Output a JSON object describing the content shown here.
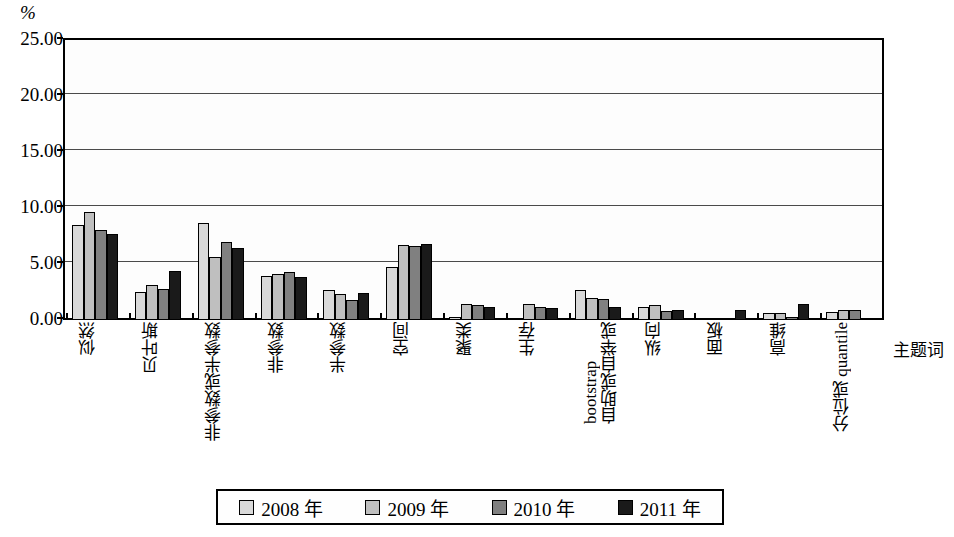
{
  "chart_data": {
    "type": "bar",
    "title": "",
    "xlabel": "主题词",
    "ylabel": "%",
    "ylim": [
      0,
      25
    ],
    "yticks": [
      "0.00",
      "5.00",
      "10.00",
      "15.00",
      "20.00",
      "25.00"
    ],
    "grid": true,
    "legend_position": "bottom",
    "categories": [
      "似然",
      "贝叶斯",
      "非参数或半参数",
      "非参数",
      "半参数",
      "空间",
      "聚类",
      "生存",
      "自助或自举或 bootstrap",
      "纵向",
      "面板",
      "高维",
      "分位或 quantile"
    ],
    "category_lines": [
      [
        "似然"
      ],
      [
        "贝叶斯"
      ],
      [
        "非参数或半参数"
      ],
      [
        "非参数"
      ],
      [
        "半参数"
      ],
      [
        "空间"
      ],
      [
        "聚类"
      ],
      [
        "生存"
      ],
      [
        "自助或自举或",
        "bootstrap"
      ],
      [
        "纵向"
      ],
      [
        "面板"
      ],
      [
        "高维"
      ],
      [
        "分位或 quantile"
      ]
    ],
    "series": [
      {
        "name": "2008 年",
        "color": "#d9d9d9",
        "values": [
          8.5,
          2.5,
          8.7,
          3.9,
          2.7,
          4.7,
          0.3,
          0.2,
          2.7,
          1.2,
          0.1,
          0.6,
          0.7
        ]
      },
      {
        "name": "2009 年",
        "color": "#bfbfbf",
        "values": [
          9.6,
          3.1,
          5.6,
          4.1,
          2.3,
          6.7,
          1.4,
          1.4,
          2.0,
          1.3,
          0.1,
          0.6,
          0.9
        ]
      },
      {
        "name": "2010 年",
        "color": "#808080",
        "values": [
          8.0,
          2.8,
          7.0,
          4.3,
          1.8,
          6.6,
          1.3,
          1.2,
          1.9,
          0.8,
          0.2,
          0.3,
          0.9
        ]
      },
      {
        "name": "2011 年",
        "color": "#1a1a1a",
        "values": [
          7.7,
          4.4,
          6.4,
          3.8,
          2.4,
          6.8,
          1.2,
          1.1,
          1.2,
          0.9,
          0.9,
          1.4,
          0.2
        ]
      }
    ]
  },
  "legend": {
    "items": [
      {
        "label": "2008 年",
        "color": "#d9d9d9"
      },
      {
        "label": "2009 年",
        "color": "#bfbfbf"
      },
      {
        "label": "2010 年",
        "color": "#808080"
      },
      {
        "label": "2011 年",
        "color": "#1a1a1a"
      }
    ]
  }
}
